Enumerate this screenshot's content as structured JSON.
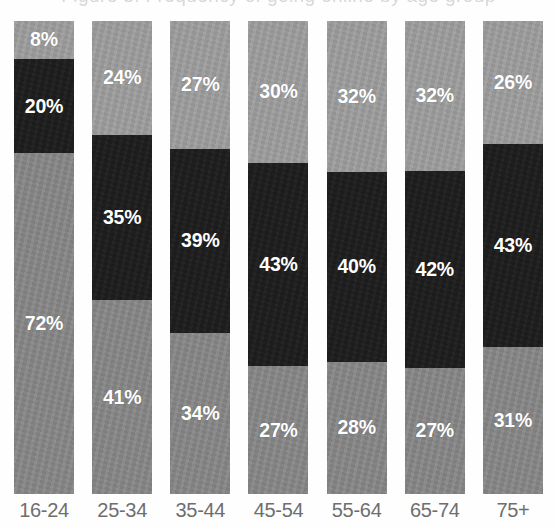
{
  "figure": {
    "title_remnant": "Figure 3: Frequency of going online by age group",
    "background_color": "#ffffff"
  },
  "legend_colors": {
    "top_segment": "#9e9e9e",
    "middle_segment": "#1d1d1d",
    "bottom_segment": "#878787",
    "label_text": "#ffffff",
    "axis_text": "#6e6e6e"
  },
  "chart_data": {
    "type": "bar",
    "stacked": true,
    "orientation": "vertical",
    "normalized_percent": true,
    "title": "",
    "xlabel": "",
    "ylabel": "",
    "ylim": [
      0,
      100
    ],
    "grid": false,
    "legend_position": "none",
    "categories": [
      "16-24",
      "25-34",
      "35-44",
      "45-54",
      "55-64",
      "65-74",
      "75+"
    ],
    "series": [
      {
        "name": "bottom-segment",
        "color": "#878787",
        "values": [
          72,
          41,
          34,
          27,
          28,
          27,
          31
        ],
        "labels": [
          "72%",
          "41%",
          "34%",
          "27%",
          "28%",
          "27%",
          "31%"
        ]
      },
      {
        "name": "middle-segment",
        "color": "#1d1d1d",
        "values": [
          20,
          35,
          39,
          43,
          40,
          42,
          43
        ],
        "labels": [
          "20%",
          "35%",
          "39%",
          "43%",
          "40%",
          "42%",
          "43%"
        ]
      },
      {
        "name": "top-segment",
        "color": "#9e9e9e",
        "values": [
          8,
          24,
          27,
          30,
          32,
          32,
          26
        ],
        "labels": [
          "8%",
          "24%",
          "27%",
          "30%",
          "32%",
          "32%",
          "26%"
        ]
      }
    ]
  },
  "bars": [
    {
      "category": "16-24",
      "top": {
        "value": 8,
        "label": "8%"
      },
      "middle": {
        "value": 20,
        "label": "20%"
      },
      "bottom": {
        "value": 72,
        "label": "72%"
      }
    },
    {
      "category": "25-34",
      "top": {
        "value": 24,
        "label": "24%"
      },
      "middle": {
        "value": 35,
        "label": "35%"
      },
      "bottom": {
        "value": 41,
        "label": "41%"
      }
    },
    {
      "category": "35-44",
      "top": {
        "value": 27,
        "label": "27%"
      },
      "middle": {
        "value": 39,
        "label": "39%"
      },
      "bottom": {
        "value": 34,
        "label": "34%"
      }
    },
    {
      "category": "45-54",
      "top": {
        "value": 30,
        "label": "30%"
      },
      "middle": {
        "value": 43,
        "label": "43%"
      },
      "bottom": {
        "value": 27,
        "label": "27%"
      }
    },
    {
      "category": "55-64",
      "top": {
        "value": 32,
        "label": "32%"
      },
      "middle": {
        "value": 40,
        "label": "40%"
      },
      "bottom": {
        "value": 28,
        "label": "28%"
      }
    },
    {
      "category": "65-74",
      "top": {
        "value": 32,
        "label": "32%"
      },
      "middle": {
        "value": 42,
        "label": "42%"
      },
      "bottom": {
        "value": 27,
        "label": "27%"
      }
    },
    {
      "category": "75+",
      "top": {
        "value": 26,
        "label": "26%"
      },
      "middle": {
        "value": 43,
        "label": "43%"
      },
      "bottom": {
        "value": 31,
        "label": "31%"
      }
    }
  ]
}
